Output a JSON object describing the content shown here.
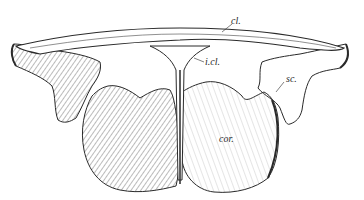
{
  "figure": {
    "labels": {
      "clavicle": "cl.",
      "interclavicle": "i.cl.",
      "scapula": "sc.",
      "coracoid": "cor."
    },
    "colors": {
      "background": "#ffffff",
      "ink": "#2a2a2a",
      "hatch": "#555555"
    }
  }
}
